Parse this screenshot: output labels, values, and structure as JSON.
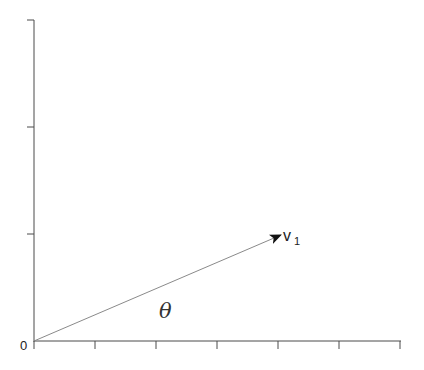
{
  "diagram": {
    "type": "vector-diagram",
    "origin_label": "0",
    "vector": {
      "label": "v",
      "subscript": "1",
      "start": [
        0,
        0
      ],
      "direction_angle_label": "θ"
    },
    "angle_label": "θ",
    "x_axis": {
      "tick_count": 6
    },
    "y_axis": {
      "tick_count": 3
    },
    "colors": {
      "axis": "#4a4a4a",
      "vector": "#8a8a8a",
      "arrowhead": "#111111",
      "text": "#222222",
      "background": "#ffffff"
    }
  }
}
